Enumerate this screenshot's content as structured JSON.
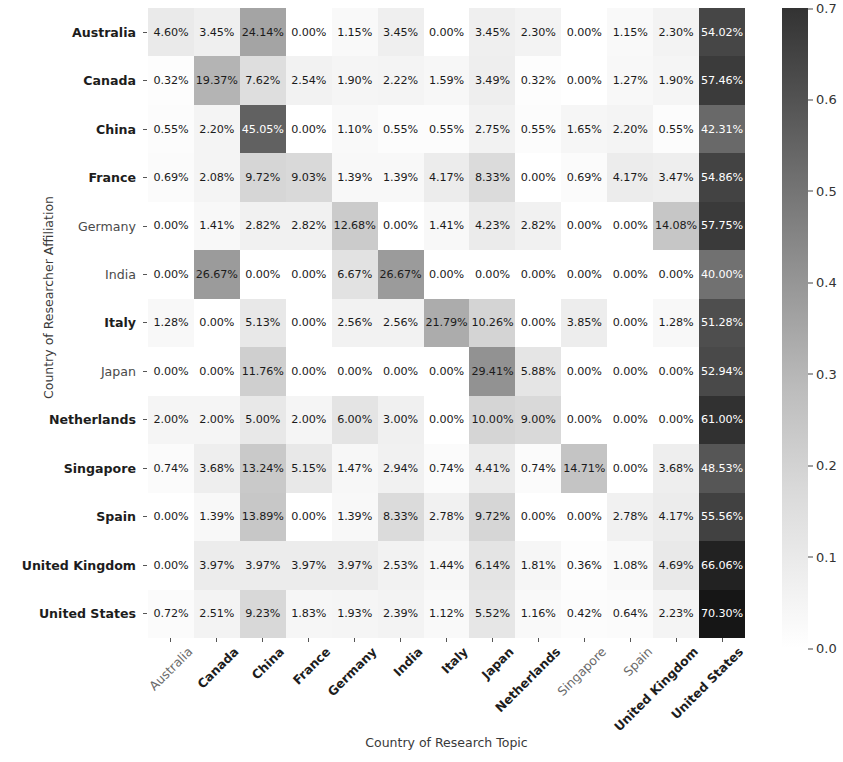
{
  "chart_data": {
    "type": "heatmap",
    "title": "",
    "xlabel": "Country of Research Topic",
    "ylabel": "Country of Researcher Affiliation",
    "colormap": "Greys",
    "vmin": 0.0,
    "vmax": 0.7,
    "value_suffix": "%",
    "value_scale": "percent",
    "grid": false,
    "legend": "colorbar-right",
    "colorbar_ticks": [
      "0.7",
      "0.6",
      "0.5",
      "0.4",
      "0.3",
      "0.2",
      "0.1",
      "0.0"
    ],
    "colorbar_tick_values": [
      0.7,
      0.6,
      0.5,
      0.4,
      0.3,
      0.2,
      0.1,
      0.0
    ],
    "categories_x": [
      {
        "label": "Australia",
        "emphasis": "light"
      },
      {
        "label": "Canada",
        "emphasis": "bold"
      },
      {
        "label": "China",
        "emphasis": "bold"
      },
      {
        "label": "France",
        "emphasis": "bold"
      },
      {
        "label": "Germany",
        "emphasis": "bold"
      },
      {
        "label": "India",
        "emphasis": "bold"
      },
      {
        "label": "Italy",
        "emphasis": "bold"
      },
      {
        "label": "Japan",
        "emphasis": "bold"
      },
      {
        "label": "Netherlands",
        "emphasis": "bold"
      },
      {
        "label": "Singapore",
        "emphasis": "light"
      },
      {
        "label": "Spain",
        "emphasis": "light"
      },
      {
        "label": "United Kingdom",
        "emphasis": "bold"
      },
      {
        "label": "United States",
        "emphasis": "bold"
      }
    ],
    "categories_y": [
      {
        "label": "Australia",
        "emphasis": "bold"
      },
      {
        "label": "Canada",
        "emphasis": "bold"
      },
      {
        "label": "China",
        "emphasis": "bold"
      },
      {
        "label": "France",
        "emphasis": "bold"
      },
      {
        "label": "Germany",
        "emphasis": "light"
      },
      {
        "label": "India",
        "emphasis": "light"
      },
      {
        "label": "Italy",
        "emphasis": "bold"
      },
      {
        "label": "Japan",
        "emphasis": "light"
      },
      {
        "label": "Netherlands",
        "emphasis": "bold"
      },
      {
        "label": "Singapore",
        "emphasis": "bold"
      },
      {
        "label": "Spain",
        "emphasis": "bold"
      },
      {
        "label": "United Kingdom",
        "emphasis": "bold"
      },
      {
        "label": "United States",
        "emphasis": "bold"
      }
    ],
    "rows": [
      {
        "name": "Australia",
        "labels": [
          "4.60%",
          "3.45%",
          "24.14%",
          "0.00%",
          "1.15%",
          "3.45%",
          "0.00%",
          "3.45%",
          "2.30%",
          "0.00%",
          "1.15%",
          "2.30%",
          "54.02%"
        ],
        "values": [
          4.6,
          3.45,
          24.14,
          0.0,
          1.15,
          3.45,
          0.0,
          3.45,
          2.3,
          0.0,
          1.15,
          2.3,
          54.02
        ]
      },
      {
        "name": "Canada",
        "labels": [
          "0.32%",
          "19.37%",
          "7.62%",
          "2.54%",
          "1.90%",
          "2.22%",
          "1.59%",
          "3.49%",
          "0.32%",
          "0.00%",
          "1.27%",
          "1.90%",
          "57.46%"
        ],
        "values": [
          0.32,
          19.37,
          7.62,
          2.54,
          1.9,
          2.22,
          1.59,
          3.49,
          0.32,
          0.0,
          1.27,
          1.9,
          57.46
        ]
      },
      {
        "name": "China",
        "labels": [
          "0.55%",
          "2.20%",
          "45.05%",
          "0.00%",
          "1.10%",
          "0.55%",
          "0.55%",
          "2.75%",
          "0.55%",
          "1.65%",
          "2.20%",
          "0.55%",
          "42.31%"
        ],
        "values": [
          0.55,
          2.2,
          45.05,
          0.0,
          1.1,
          0.55,
          0.55,
          2.75,
          0.55,
          1.65,
          2.2,
          0.55,
          42.31
        ]
      },
      {
        "name": "France",
        "labels": [
          "0.69%",
          "2.08%",
          "9.72%",
          "9.03%",
          "1.39%",
          "1.39%",
          "4.17%",
          "8.33%",
          "0.00%",
          "0.69%",
          "4.17%",
          "3.47%",
          "54.86%"
        ],
        "values": [
          0.69,
          2.08,
          9.72,
          9.03,
          1.39,
          1.39,
          4.17,
          8.33,
          0.0,
          0.69,
          4.17,
          3.47,
          54.86
        ]
      },
      {
        "name": "Germany",
        "labels": [
          "0.00%",
          "1.41%",
          "2.82%",
          "2.82%",
          "12.68%",
          "0.00%",
          "1.41%",
          "4.23%",
          "2.82%",
          "0.00%",
          "0.00%",
          "14.08%",
          "57.75%"
        ],
        "values": [
          0.0,
          1.41,
          2.82,
          2.82,
          12.68,
          0.0,
          1.41,
          4.23,
          2.82,
          0.0,
          0.0,
          14.08,
          57.75
        ]
      },
      {
        "name": "India",
        "labels": [
          "0.00%",
          "26.67%",
          "0.00%",
          "0.00%",
          "6.67%",
          "26.67%",
          "0.00%",
          "0.00%",
          "0.00%",
          "0.00%",
          "0.00%",
          "0.00%",
          "40.00%"
        ],
        "values": [
          0.0,
          26.67,
          0.0,
          0.0,
          6.67,
          26.67,
          0.0,
          0.0,
          0.0,
          0.0,
          0.0,
          0.0,
          40.0
        ]
      },
      {
        "name": "Italy",
        "labels": [
          "1.28%",
          "0.00%",
          "5.13%",
          "0.00%",
          "2.56%",
          "2.56%",
          "21.79%",
          "10.26%",
          "0.00%",
          "3.85%",
          "0.00%",
          "1.28%",
          "51.28%"
        ],
        "values": [
          1.28,
          0.0,
          5.13,
          0.0,
          2.56,
          2.56,
          21.79,
          10.26,
          0.0,
          3.85,
          0.0,
          1.28,
          51.28
        ]
      },
      {
        "name": "Japan",
        "labels": [
          "0.00%",
          "0.00%",
          "11.76%",
          "0.00%",
          "0.00%",
          "0.00%",
          "0.00%",
          "29.41%",
          "5.88%",
          "0.00%",
          "0.00%",
          "0.00%",
          "52.94%"
        ],
        "values": [
          0.0,
          0.0,
          11.76,
          0.0,
          0.0,
          0.0,
          0.0,
          29.41,
          5.88,
          0.0,
          0.0,
          0.0,
          52.94
        ]
      },
      {
        "name": "Netherlands",
        "labels": [
          "2.00%",
          "2.00%",
          "5.00%",
          "2.00%",
          "6.00%",
          "3.00%",
          "0.00%",
          "10.00%",
          "9.00%",
          "0.00%",
          "0.00%",
          "0.00%",
          "61.00%"
        ],
        "values": [
          2.0,
          2.0,
          5.0,
          2.0,
          6.0,
          3.0,
          0.0,
          10.0,
          9.0,
          0.0,
          0.0,
          0.0,
          61.0
        ]
      },
      {
        "name": "Singapore",
        "labels": [
          "0.74%",
          "3.68%",
          "13.24%",
          "5.15%",
          "1.47%",
          "2.94%",
          "0.74%",
          "4.41%",
          "0.74%",
          "14.71%",
          "0.00%",
          "3.68%",
          "48.53%"
        ],
        "values": [
          0.74,
          3.68,
          13.24,
          5.15,
          1.47,
          2.94,
          0.74,
          4.41,
          0.74,
          14.71,
          0.0,
          3.68,
          48.53
        ]
      },
      {
        "name": "Spain",
        "labels": [
          "0.00%",
          "1.39%",
          "13.89%",
          "0.00%",
          "1.39%",
          "8.33%",
          "2.78%",
          "9.72%",
          "0.00%",
          "0.00%",
          "2.78%",
          "4.17%",
          "55.56%"
        ],
        "values": [
          0.0,
          1.39,
          13.89,
          0.0,
          1.39,
          8.33,
          2.78,
          9.72,
          0.0,
          0.0,
          2.78,
          4.17,
          55.56
        ]
      },
      {
        "name": "United Kingdom",
        "labels": [
          "0.00%",
          "3.97%",
          "3.97%",
          "3.97%",
          "3.97%",
          "2.53%",
          "1.44%",
          "6.14%",
          "1.81%",
          "0.36%",
          "1.08%",
          "4.69%",
          "66.06%"
        ],
        "values": [
          0.0,
          3.97,
          3.97,
          3.97,
          3.97,
          2.53,
          1.44,
          6.14,
          1.81,
          0.36,
          1.08,
          4.69,
          66.06
        ]
      },
      {
        "name": "United States",
        "labels": [
          "0.72%",
          "2.51%",
          "9.23%",
          "1.83%",
          "1.93%",
          "2.39%",
          "1.12%",
          "5.52%",
          "1.16%",
          "0.42%",
          "0.64%",
          "2.23%",
          "70.30%"
        ],
        "values": [
          0.72,
          2.51,
          9.23,
          1.83,
          1.93,
          2.39,
          1.12,
          5.52,
          1.16,
          0.42,
          0.64,
          2.23,
          70.3
        ]
      }
    ]
  }
}
